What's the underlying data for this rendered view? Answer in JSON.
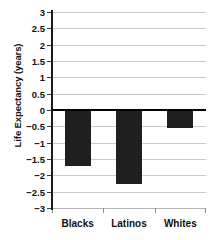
{
  "chart_data": {
    "type": "bar",
    "title": "",
    "subtitle": "",
    "xlabel": "",
    "ylabel": "Life Expectancy (years)",
    "categories": [
      "Blacks",
      "Latinos",
      "Whites"
    ],
    "values": [
      -1.7,
      -2.25,
      -0.55
    ],
    "series": [
      {
        "name": "Change in Life Expectancy",
        "values": [
          -1.7,
          -2.25,
          -0.55
        ]
      }
    ],
    "ylim": [
      -3,
      3
    ],
    "ytick_labels": [
      "3",
      "2.5",
      "2",
      "1.5",
      "1",
      "0.5",
      "0",
      "-0.5",
      "-1",
      "-1.5",
      "-2",
      "-2.5",
      "-3"
    ],
    "ytick_values": [
      3,
      2.5,
      2,
      1.5,
      1,
      0.5,
      0,
      -0.5,
      -1,
      -1.5,
      -2,
      -2.5,
      -3
    ],
    "grid": true,
    "legend": null,
    "legend_position": "none",
    "bar_color": "#1f1f1f",
    "grid_color": "#c9c9c9",
    "axis_color": "#1b1b1b",
    "zero_line_color": "#000000",
    "annotations": []
  }
}
